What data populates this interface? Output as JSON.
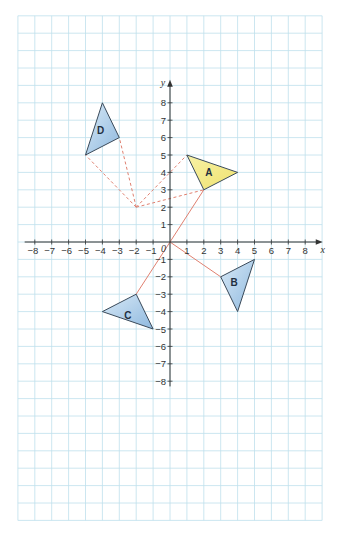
{
  "diagram": {
    "type": "coordinate-grid",
    "axes": {
      "x_label": "x",
      "y_label": "y",
      "origin_label": "0",
      "x_ticks": [
        -8,
        -7,
        -6,
        -5,
        -4,
        -3,
        -2,
        -1,
        1,
        2,
        3,
        4,
        5,
        6,
        7,
        8
      ],
      "y_ticks": [
        -8,
        -7,
        -6,
        -5,
        -4,
        -3,
        -2,
        -1,
        1,
        2,
        3,
        4,
        5,
        6,
        7,
        8
      ]
    },
    "grid": {
      "x_min": -9,
      "x_max": 9,
      "y_min": -16,
      "y_max": 13,
      "color": "#bfe0ec"
    },
    "triangles": [
      {
        "label": "A",
        "vertices": [
          [
            1,
            5
          ],
          [
            4,
            4
          ],
          [
            2,
            3
          ]
        ],
        "fill": "#f5ec8a",
        "label_pos": [
          2.3,
          4
        ]
      },
      {
        "label": "B",
        "vertices": [
          [
            3,
            -2
          ],
          [
            5,
            -1
          ],
          [
            4,
            -4
          ]
        ],
        "fill": "#a9cbe8",
        "label_pos": [
          3.8,
          -2.3
        ]
      },
      {
        "label": "C",
        "vertices": [
          [
            -2,
            -3
          ],
          [
            -4,
            -4
          ],
          [
            -1,
            -5
          ]
        ],
        "fill": "#a9cbe8",
        "label_pos": [
          -2.5,
          -4.2
        ]
      },
      {
        "label": "D",
        "vertices": [
          [
            -4,
            8
          ],
          [
            -3,
            6
          ],
          [
            -5,
            5
          ]
        ],
        "fill": "#a9cbe8",
        "label_pos": [
          -4.1,
          6.4
        ]
      }
    ],
    "solid_lines": [
      {
        "from": [
          0,
          0
        ],
        "to": [
          2,
          3
        ]
      },
      {
        "from": [
          0,
          0
        ],
        "to": [
          3,
          -2
        ]
      },
      {
        "from": [
          0,
          0
        ],
        "to": [
          -2,
          -3
        ]
      }
    ],
    "dashed_lines": [
      {
        "from": [
          -2,
          2
        ],
        "to": [
          1,
          5
        ]
      },
      {
        "from": [
          -2,
          2
        ],
        "to": [
          2,
          3
        ]
      },
      {
        "from": [
          -2,
          2
        ],
        "to": [
          -5,
          5
        ]
      },
      {
        "from": [
          -2,
          2
        ],
        "to": [
          -3,
          6
        ]
      }
    ],
    "colors": {
      "line": "#e08070",
      "shape_blue": "#a9cbe8",
      "shape_yellow": "#f5ec8a",
      "grid": "#bfe0ec"
    }
  }
}
